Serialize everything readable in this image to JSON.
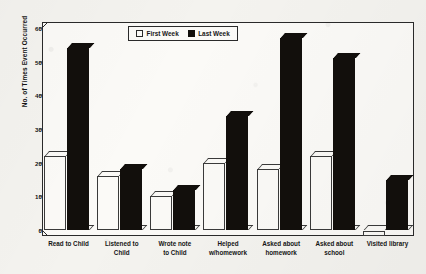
{
  "chart_data": {
    "type": "bar",
    "title": "",
    "xlabel": "",
    "ylabel": "No. of Times Event Occurred",
    "ylim": [
      0,
      60
    ],
    "yticks": [
      0,
      10,
      20,
      30,
      40,
      50,
      60
    ],
    "grid": false,
    "legend_position": "top-center",
    "categories": [
      "Read to Child",
      "Listened to Child",
      "Wrote note to Child",
      "Helped w/homework",
      "Asked about homework",
      "Asked about school",
      "Visited library"
    ],
    "category_lines": [
      [
        "Read to Child"
      ],
      [
        "Listened to",
        "Child"
      ],
      [
        "Wrote note",
        "to Child"
      ],
      [
        "Helped",
        "w/homework"
      ],
      [
        "Asked about",
        "homework"
      ],
      [
        "Asked about",
        "school"
      ],
      [
        "Visited library"
      ]
    ],
    "series": [
      {
        "name": "First Week",
        "color": "#ffffff",
        "values": [
          22,
          16,
          10,
          20,
          18,
          22,
          0
        ]
      },
      {
        "name": "Last Week",
        "color": "#120f0c",
        "values": [
          54,
          18,
          12,
          34,
          57,
          51,
          15
        ]
      }
    ]
  },
  "legend": {
    "items": [
      {
        "label": "First Week",
        "swatch": "open-square"
      },
      {
        "label": "Last Week",
        "swatch": "filled-square"
      }
    ]
  },
  "axes": {
    "y_title": "No. of Times Event Occurred",
    "y_tick_labels": [
      "0",
      "10",
      "20",
      "30",
      "40",
      "50",
      "60"
    ]
  }
}
